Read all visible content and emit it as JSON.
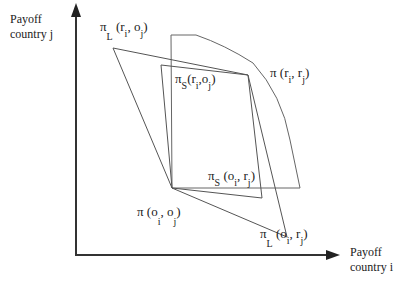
{
  "axes": {
    "y_label_line1": "Payoff",
    "y_label_line2": "country j",
    "x_label_line1": "Payoff",
    "x_label_line2": "country i"
  },
  "labels": {
    "pi_L_r_o": {
      "pi": "π",
      "sub": "L",
      "open": "(r",
      "i": "i",
      "mid": ", o",
      "j": "j",
      "close": ")"
    },
    "pi_S_r_o": {
      "pi": "π",
      "sub": "S",
      "open": "(r",
      "i": "i",
      "mid": ",o",
      "j": "j",
      "close": ")"
    },
    "pi_r_r": {
      "pi": "π",
      "open": "(r",
      "i": "i",
      "mid": ",  r",
      "j": "j",
      "close": ")"
    },
    "pi_S_o_r": {
      "pi": "π",
      "sub": "S",
      "open": "(o",
      "i": "i",
      "mid": ", r",
      "j": "j",
      "close": ")"
    },
    "pi_o_o": {
      "pi": "π",
      "open": "(o",
      "i": "i",
      "mid": ", o",
      "j": "j",
      "close": ")"
    },
    "pi_L_o_r": {
      "pi": "π",
      "sub": "L",
      "open": "(o",
      "i": "i",
      "mid": ",  r",
      "j": "j",
      "close": ")"
    }
  },
  "colors": {
    "axis": "#333333",
    "line": "#555555",
    "background": "#ffffff"
  }
}
